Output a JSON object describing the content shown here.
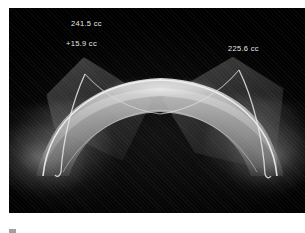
{
  "figure": {
    "kind": "3d-volume-render-scan",
    "background_color": "#000000",
    "page_color": "#ffffff",
    "alt": "Three-dimensional volume rendering of an arched translucent anatomical surface on a black background"
  },
  "overlays": {
    "volume_total": "241.5 cc",
    "volume_delta": "+15.9 cc",
    "volume_second": "225.6 cc",
    "text_color": "#e8e8e8"
  },
  "caption": {
    "marker": "",
    "text": ""
  }
}
